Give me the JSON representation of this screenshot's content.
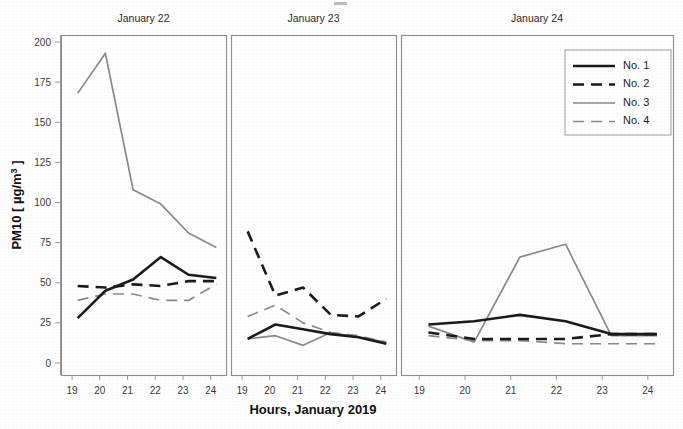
{
  "chart_data": {
    "type": "line",
    "title": "",
    "xlabel": "Hours, January 2019",
    "ylabel": "PM10 [ µg/m³ ]",
    "ylabel_main": "PM10 [ µg/m",
    "ylabel_exponent": "3",
    "ylabel_tail": "]",
    "ylim": [
      0,
      212
    ],
    "xlim": [
      18.6,
      24.55
    ],
    "grid": false,
    "legend_position": "top-right (panel 3)",
    "yticks": [
      0,
      25,
      50,
      75,
      100,
      125,
      150,
      175,
      200
    ],
    "ytick_labels": [
      "0",
      "25",
      "50",
      "75",
      "100",
      "125",
      "150",
      "175",
      "200"
    ],
    "xticks": [
      19,
      20,
      21,
      22,
      23,
      24
    ],
    "xtick_labels": [
      "19",
      "20",
      "21",
      "22",
      "23",
      "24"
    ],
    "legend": [
      {
        "name": "No. 1",
        "color": "#1b1b1b",
        "width": 2.6,
        "dash": "none"
      },
      {
        "name": "No. 2",
        "color": "#1b1b1b",
        "width": 2.6,
        "dash": "11,7"
      },
      {
        "name": "No. 3",
        "color": "#8a8a8a",
        "width": 1.7,
        "dash": "none"
      },
      {
        "name": "No. 4",
        "color": "#8a8a8a",
        "width": 1.7,
        "dash": "11,7"
      }
    ],
    "panels": [
      {
        "title": "January 22",
        "series": [
          {
            "name": "No. 1",
            "x": [
              19.2,
              20.2,
              21.2,
              22.2,
              23.2,
              24.2
            ],
            "values": [
              28,
              45,
              52,
              66,
              55,
              53
            ]
          },
          {
            "name": "No. 2",
            "x": [
              19.2,
              20.2,
              21.2,
              22.2,
              23.2,
              24.2
            ],
            "values": [
              48,
              47,
              49,
              48,
              51,
              51
            ]
          },
          {
            "name": "No. 3",
            "x": [
              19.2,
              20.2,
              21.2,
              22.2,
              23.2,
              24.2
            ],
            "values": [
              168,
              193,
              108,
              99,
              81,
              72
            ]
          },
          {
            "name": "No. 4",
            "x": [
              19.2,
              20.2,
              21.2,
              22.2,
              23.2,
              24.2
            ],
            "values": [
              39,
              43,
              43,
              39,
              39,
              49
            ]
          }
        ]
      },
      {
        "title": "January 23",
        "series": [
          {
            "name": "No. 1",
            "x": [
              19.2,
              20.2,
              21.2,
              22.2,
              23.2,
              24.2
            ],
            "values": [
              15,
              24,
              21,
              18,
              16,
              12
            ]
          },
          {
            "name": "No. 2",
            "x": [
              19.2,
              20.2,
              21.2,
              22.2,
              23.2,
              24.2
            ],
            "values": [
              82,
              42,
              47,
              30,
              29,
              40
            ]
          },
          {
            "name": "No. 3",
            "x": [
              19.2,
              20.2,
              21.2,
              22.2,
              23.2,
              24.2
            ],
            "values": [
              15,
              17,
              11,
              19,
              16,
              13
            ]
          },
          {
            "name": "No. 4",
            "x": [
              19.2,
              20.2,
              21.2,
              22.2,
              23.2,
              24.2
            ],
            "values": [
              29,
              36,
              25,
              19,
              17,
              13
            ]
          }
        ]
      },
      {
        "title": "January 24",
        "series": [
          {
            "name": "No. 1",
            "x": [
              19.2,
              20.2,
              21.2,
              22.2,
              23.2,
              24.2
            ],
            "values": [
              24,
              26,
              30,
              26,
              18,
              18
            ]
          },
          {
            "name": "No. 2",
            "x": [
              19.2,
              20.2,
              21.2,
              22.2,
              23.2,
              24.2
            ],
            "values": [
              19,
              15,
              15,
              15,
              18,
              18
            ]
          },
          {
            "name": "No. 3",
            "x": [
              19.2,
              20.2,
              21.2,
              22.2,
              23.2,
              24.2
            ],
            "values": [
              23,
              13,
              66,
              74,
              17,
              17
            ]
          },
          {
            "name": "No. 4",
            "x": [
              19.2,
              20.2,
              21.2,
              22.2,
              23.2,
              24.2
            ],
            "values": [
              17,
              14,
              14,
              12,
              12,
              12
            ]
          }
        ]
      }
    ]
  }
}
